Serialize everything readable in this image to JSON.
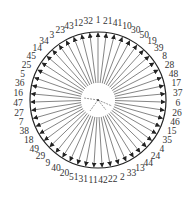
{
  "diagram": {
    "type": "circular-radial-sequence",
    "center": [
      98,
      100
    ],
    "outer_radius": 68,
    "inner_radius": 17,
    "label_radius": 80,
    "start_angle_deg": -90,
    "direction": "clockwise",
    "arrow_direction": "outward",
    "colors": {
      "line": "#333333",
      "circle": "#222222",
      "text": "#333333",
      "background": "#ffffff"
    },
    "labels": [
      1,
      21,
      41,
      10,
      30,
      50,
      19,
      39,
      8,
      28,
      48,
      17,
      37,
      6,
      26,
      46,
      15,
      35,
      4,
      24,
      44,
      13,
      33,
      2,
      22,
      42,
      11,
      31,
      51,
      20,
      40,
      9,
      29,
      49,
      18,
      38,
      7,
      27,
      47,
      16,
      36,
      5,
      25,
      45,
      14,
      34,
      3,
      23,
      43,
      12,
      32
    ]
  }
}
